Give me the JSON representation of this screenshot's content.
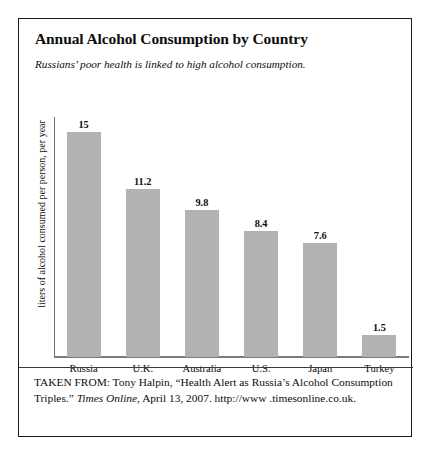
{
  "figure": {
    "title": "Annual Alcohol Consumption by Country",
    "subtitle": "Russians’ poor health is linked to high alcohol consumption."
  },
  "chart_data": {
    "type": "bar",
    "title": "Annual Alcohol Consumption by Country",
    "subtitle": "Russians’ poor health is linked to high alcohol consumption.",
    "categories": [
      "Russia",
      "U.K.",
      "Australia",
      "U.S.",
      "Japan",
      "Turkey"
    ],
    "values": [
      15,
      11.2,
      9.8,
      8.4,
      7.6,
      1.5
    ],
    "value_labels": [
      "15",
      "11.2",
      "9.8",
      "8.4",
      "7.6",
      "1.5"
    ],
    "xlabel": "",
    "ylabel": "liters of alcohol consumed per person, per year",
    "ylim": [
      0,
      16
    ],
    "grid": false,
    "legend": false,
    "bar_color": "#b2b2b2",
    "axis_color": "#7a7a7a"
  },
  "citation": {
    "line1_prefix": "TAKEN FROM: Tony Halpin, “Health Alert as Russia’s Alcohol",
    "line2_prefix": "Consumption Triples.” ",
    "line2_italic": "Times Online",
    "line2_suffix": ", April 13, 2007. http://www",
    "line3": ".timesonline.co.uk."
  }
}
